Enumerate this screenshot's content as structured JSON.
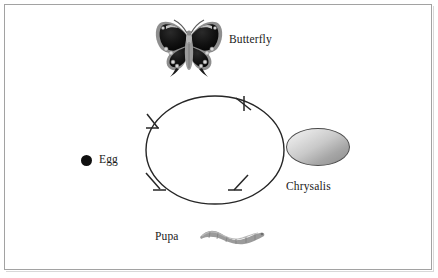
{
  "diagram": {
    "background_color": "#ffffff",
    "border_color": "#a2a2a2",
    "text_color": "#1a1a1a",
    "labels": {
      "butterfly": "Butterfly",
      "egg": "Egg",
      "chrysalis": "Chrysalis",
      "pupa": "Pupa"
    },
    "stages": [
      {
        "id": "egg",
        "label": "Egg",
        "icon": "black-dot-icon",
        "color": "#101010",
        "position": "left"
      },
      {
        "id": "pupa",
        "label": "Pupa",
        "icon": "caterpillar-icon",
        "color": "#9a9a9a",
        "position": "bottom"
      },
      {
        "id": "chrysalis",
        "label": "Chrysalis",
        "icon": "chrysalis-oval-icon",
        "color": "#b0b0b0",
        "position": "right"
      },
      {
        "id": "butterfly",
        "label": "Butterfly",
        "icon": "butterfly-icon",
        "color": "#141414",
        "position": "top"
      }
    ],
    "cycle": {
      "shape": "ellipse",
      "stroke_color": "#262626",
      "arrow_count": 4,
      "direction": "counterclockwise",
      "arrow_positions": [
        "top-left",
        "top-right",
        "bottom-left",
        "bottom-right"
      ]
    }
  }
}
